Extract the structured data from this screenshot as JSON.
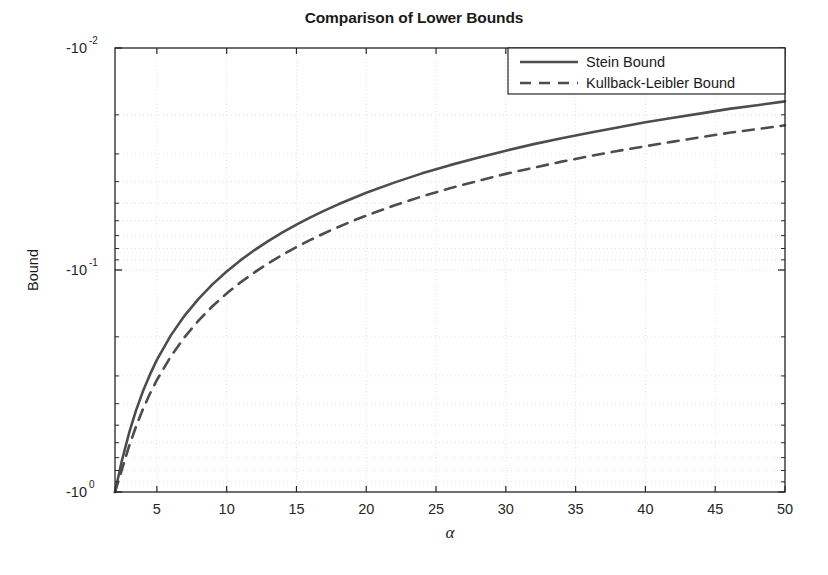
{
  "chart_data": {
    "type": "line",
    "title": "Comparison of Lower Bounds",
    "xlabel": "α",
    "ylabel": "Bound",
    "xlim": [
      2,
      50
    ],
    "ylim": [
      -1,
      -0.01
    ],
    "yscale": "negative-log",
    "grid": true,
    "legend_position": "top-right",
    "xticks": [
      5,
      10,
      15,
      20,
      25,
      30,
      35,
      40,
      45,
      50
    ],
    "xtick_labels": [
      "5",
      "10",
      "15",
      "20",
      "25",
      "30",
      "35",
      "40",
      "45",
      "50"
    ],
    "yticks": [
      -1,
      -0.1,
      -0.01
    ],
    "ytick_labels": [
      "-10^0",
      "-10^-1",
      "-10^-2"
    ],
    "ytick_mantissa": [
      "-10",
      "-10",
      "-10"
    ],
    "ytick_exponent": [
      "0",
      "-1",
      "-2"
    ],
    "series": [
      {
        "name": "Stein Bound",
        "style": "solid",
        "color": "#4d4d4d",
        "x": [
          2,
          2.5,
          3,
          3.5,
          4,
          4.5,
          5,
          6,
          7,
          8,
          9,
          10,
          11,
          12,
          13,
          14,
          15,
          16,
          17,
          18,
          19,
          20,
          22,
          24,
          26,
          28,
          30,
          32,
          34,
          36,
          38,
          40,
          42,
          44,
          46,
          48,
          50
        ],
        "y": [
          -1.0,
          -0.72,
          -0.545,
          -0.43,
          -0.352,
          -0.296,
          -0.254,
          -0.197,
          -0.16,
          -0.1345,
          -0.1158,
          -0.1015,
          -0.0903,
          -0.0813,
          -0.0739,
          -0.0677,
          -0.0624,
          -0.0579,
          -0.054,
          -0.0506,
          -0.0476,
          -0.0449,
          -0.0404,
          -0.0367,
          -0.0337,
          -0.0312,
          -0.029,
          -0.0271,
          -0.0255,
          -0.0241,
          -0.0228,
          -0.0216,
          -0.0206,
          -0.0197,
          -0.0188,
          -0.0181,
          -0.0174
        ]
      },
      {
        "name": "Kullback-Leibler Bound",
        "style": "dashed",
        "color": "#4d4d4d",
        "x": [
          2,
          2.5,
          3,
          3.5,
          4,
          4.5,
          5,
          6,
          7,
          8,
          9,
          10,
          11,
          12,
          13,
          14,
          15,
          16,
          17,
          18,
          19,
          20,
          22,
          24,
          26,
          28,
          30,
          32,
          34,
          36,
          38,
          40,
          42,
          44,
          46,
          48,
          50
        ],
        "y": [
          -1.0,
          -0.79,
          -0.625,
          -0.508,
          -0.424,
          -0.361,
          -0.313,
          -0.245,
          -0.2,
          -0.1685,
          -0.1453,
          -0.1275,
          -0.1136,
          -0.1024,
          -0.0931,
          -0.0854,
          -0.0788,
          -0.0732,
          -0.0683,
          -0.064,
          -0.0602,
          -0.0569,
          -0.0512,
          -0.0466,
          -0.0428,
          -0.0397,
          -0.0369,
          -0.0346,
          -0.0325,
          -0.0307,
          -0.0291,
          -0.0277,
          -0.0264,
          -0.0252,
          -0.0241,
          -0.0232,
          -0.0223
        ]
      }
    ],
    "legend": [
      {
        "label": "Stein Bound",
        "style": "solid"
      },
      {
        "label": "Kullback-Leibler Bound",
        "style": "dashed"
      }
    ],
    "colors": {
      "line": "#4d4d4d",
      "axis": "#262626",
      "grid": "#d9d9d9",
      "background": "#ffffff",
      "text": "#1a1a1a"
    }
  }
}
